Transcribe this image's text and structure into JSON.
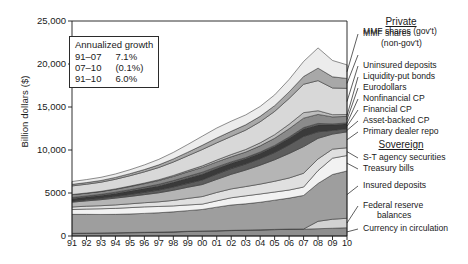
{
  "chart_data": {
    "type": "area",
    "stacked": true,
    "title": "",
    "xlabel": "",
    "ylabel": "Billion dollars ($)",
    "xlim": [
      1991,
      2010
    ],
    "ylim": [
      0,
      25000
    ],
    "yticks": [
      0,
      5000,
      10000,
      15000,
      20000,
      25000
    ],
    "ytick_labels": [
      "0",
      "5000",
      "10,000",
      "15,000",
      "20,000",
      "25,000"
    ],
    "x": [
      1991,
      1992,
      1993,
      1994,
      1995,
      1996,
      1997,
      1998,
      1999,
      2000,
      2001,
      2002,
      2003,
      2004,
      2005,
      2006,
      2007,
      2008,
      2009,
      2010
    ],
    "xtick_labels": [
      "91",
      "92",
      "93",
      "94",
      "95",
      "96",
      "97",
      "98",
      "99",
      "00",
      "01",
      "02",
      "03",
      "04",
      "05",
      "06",
      "07",
      "08",
      "09",
      "10"
    ],
    "grid": false,
    "legend_position": "right",
    "stack_order_bottom_to_top": [
      "Currency in circulation",
      "Federal reserve balances",
      "Insured deposits",
      "Treasury bills",
      "S-T agency securities",
      "Primary dealer repo",
      "Asset-backed CP",
      "Financial CP",
      "Nonfinancial CP",
      "Eurodollars",
      "Liquidity-put bonds",
      "Uninsured deposits",
      "MMF shares (gov't)",
      "MMF shares (non-gov't)"
    ],
    "series": [
      {
        "name": "Currency in circulation",
        "group": "Sovereign",
        "color": "#8e8e8e",
        "values": [
          280,
          300,
          320,
          350,
          375,
          400,
          425,
          460,
          520,
          560,
          590,
          630,
          665,
          700,
          740,
          780,
          790,
          850,
          900,
          960
        ]
      },
      {
        "name": "Federal reserve balances",
        "group": "Sovereign",
        "color": "#d2d2d2",
        "values": [
          35,
          35,
          35,
          35,
          35,
          30,
          30,
          30,
          30,
          25,
          25,
          25,
          25,
          25,
          25,
          25,
          25,
          860,
          1050,
          1100
        ]
      },
      {
        "name": "Insured deposits",
        "group": "Sovereign",
        "color": "#9e9e9e",
        "values": [
          2200,
          2180,
          2150,
          2130,
          2150,
          2200,
          2250,
          2320,
          2400,
          2500,
          2740,
          2950,
          3050,
          3200,
          3400,
          3600,
          3900,
          4400,
          5200,
          5500
        ]
      },
      {
        "name": "Treasury bills",
        "group": "Sovereign",
        "color": "#f2f2f2",
        "values": [
          560,
          620,
          660,
          700,
          740,
          760,
          730,
          690,
          660,
          620,
          730,
          840,
          930,
          960,
          950,
          940,
          980,
          1500,
          1900,
          1800
        ]
      },
      {
        "name": "S-T agency securities",
        "group": "Sovereign",
        "color": "#e0e0e0",
        "values": [
          300,
          330,
          360,
          400,
          440,
          480,
          540,
          640,
          760,
          880,
          980,
          1030,
          1080,
          1150,
          1250,
          1400,
          1600,
          1350,
          1050,
          900
        ]
      },
      {
        "name": "Primary dealer repo",
        "group": "Private",
        "color": "#b5b5b5",
        "values": [
          560,
          620,
          700,
          790,
          860,
          940,
          1050,
          1180,
          1300,
          1400,
          1520,
          1700,
          1920,
          2200,
          2500,
          2850,
          3100,
          2400,
          1750,
          1850
        ]
      },
      {
        "name": "Asset-backed CP",
        "group": "Private",
        "color": "#5d5d5d",
        "values": [
          120,
          140,
          165,
          195,
          230,
          270,
          320,
          380,
          450,
          540,
          620,
          660,
          700,
          760,
          840,
          1000,
          1180,
          760,
          430,
          370
        ]
      },
      {
        "name": "Financial CP",
        "group": "Private",
        "color": "#3a3a3a",
        "values": [
          290,
          300,
          320,
          350,
          390,
          430,
          480,
          540,
          600,
          660,
          640,
          620,
          610,
          640,
          700,
          780,
          870,
          790,
          620,
          560
        ]
      },
      {
        "name": "Nonfinancial CP",
        "group": "Private",
        "color": "#6e6e6e",
        "values": [
          130,
          130,
          135,
          145,
          160,
          175,
          190,
          205,
          220,
          230,
          190,
          160,
          140,
          130,
          130,
          140,
          160,
          180,
          130,
          110
        ]
      },
      {
        "name": "Eurodollars",
        "group": "Private",
        "color": "#8a8a8a",
        "values": [
          330,
          320,
          320,
          340,
          370,
          400,
          440,
          480,
          520,
          560,
          580,
          600,
          640,
          720,
          830,
          960,
          1100,
          1050,
          820,
          760
        ]
      },
      {
        "name": "Liquidity-put bonds",
        "group": "Private",
        "color": "#bdbdbd",
        "values": [
          20,
          25,
          30,
          40,
          55,
          70,
          90,
          115,
          145,
          180,
          220,
          260,
          300,
          350,
          420,
          520,
          640,
          430,
          260,
          210
        ]
      },
      {
        "name": "Uninsured deposits",
        "group": "Private",
        "color": "#d8d8d8",
        "values": [
          1000,
          1020,
          1060,
          1120,
          1200,
          1300,
          1420,
          1560,
          1720,
          1900,
          2000,
          2100,
          2250,
          2450,
          2700,
          3000,
          3300,
          3500,
          3100,
          3050
        ]
      },
      {
        "name": "MMF shares (gov't)",
        "group": "Private",
        "color": "#a8a8a8",
        "values": [
          180,
          190,
          200,
          215,
          240,
          270,
          310,
          360,
          420,
          490,
          560,
          600,
          620,
          630,
          670,
          760,
          900,
          1450,
          1300,
          1150
        ]
      },
      {
        "name": "MMF shares (non-gov't)",
        "group": "Private",
        "color": "#ececec",
        "values": [
          330,
          350,
          370,
          400,
          460,
          540,
          640,
          760,
          900,
          1060,
          1160,
          1180,
          1150,
          1150,
          1250,
          1450,
          1750,
          2350,
          1900,
          1580
        ]
      }
    ],
    "annotation": {
      "title": "Annualized growth",
      "rows": [
        {
          "period": "91–07",
          "value": "7.1%"
        },
        {
          "period": "07–10",
          "value": "(0.1%)"
        },
        {
          "period": "91–10",
          "value": "6.0%"
        }
      ]
    },
    "legend_groups": [
      {
        "heading": "Private",
        "items": [
          {
            "label": "MMF shares",
            "label2": "(non-gov't)"
          },
          {
            "label": "MMF shares (gov't)"
          },
          {
            "label": "Uninsured deposits"
          },
          {
            "label": "Liquidity-put bonds"
          },
          {
            "label": "Eurodollars"
          },
          {
            "label": "Nonfinancial CP"
          },
          {
            "label": "Financial CP"
          },
          {
            "label": "Asset-backed CP"
          },
          {
            "label": "Primary dealer repo"
          }
        ]
      },
      {
        "heading": "Sovereign",
        "items": [
          {
            "label": "S-T agency securities"
          },
          {
            "label": "Treasury bills"
          },
          {
            "label": "Insured deposits"
          },
          {
            "label": "Federal reserve",
            "label2": "balances"
          },
          {
            "label": "Currency in circulation"
          }
        ]
      }
    ]
  }
}
